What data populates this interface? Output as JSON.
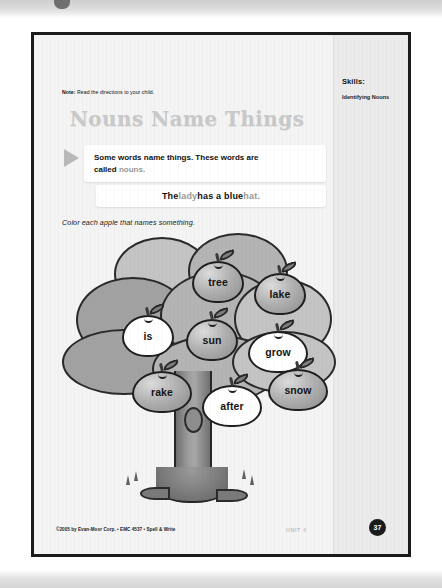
{
  "note": {
    "prefix": "Note:",
    "text": "Read the directions to your child."
  },
  "title": "Nouns Name Things",
  "skills": {
    "heading": "Skills:",
    "detail": "Identifying Nouns"
  },
  "instruction": {
    "line1": "Some words name things. These words are",
    "line2_prefix": "called ",
    "line2_term": "nouns."
  },
  "example": {
    "w1": "The ",
    "w2": "lady",
    "w3": " has a blue ",
    "w4": "hat."
  },
  "direction": "Color each apple that names something.",
  "apples": [
    {
      "label": "tree",
      "state": "filled"
    },
    {
      "label": "lake",
      "state": "filled"
    },
    {
      "label": "is",
      "state": "open"
    },
    {
      "label": "sun",
      "state": "filled"
    },
    {
      "label": "grow",
      "state": "open"
    },
    {
      "label": "rake",
      "state": "filled"
    },
    {
      "label": "after",
      "state": "open"
    },
    {
      "label": "snow",
      "state": "filled"
    }
  ],
  "footer": {
    "copyright": "©2005 by Evan-Moor Corp. • EMC 4537 • Spell & Write",
    "unit": "UNIT 4",
    "page_number": "37"
  },
  "colors": {
    "page_bg": "#f4f4f4",
    "border": "#1b1b1b",
    "title_gray": "#c9c9c9",
    "noun_gray": "#9a9a9a",
    "apple_fill": "#b0b0b0",
    "rail_bg": "#ebebeb"
  }
}
